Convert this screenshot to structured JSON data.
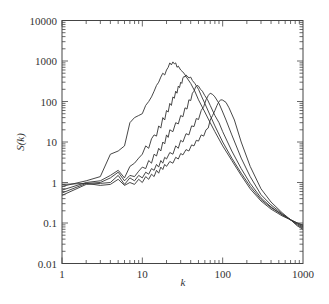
{
  "chart_data": {
    "type": "line",
    "title": "",
    "xlabel": "k",
    "ylabel": "S(k)",
    "xscale": "log",
    "yscale": "log",
    "xlim": [
      1,
      1000
    ],
    "ylim": [
      0.01,
      10000
    ],
    "grid": false,
    "legend": null,
    "x_ticks": [
      1,
      10,
      100,
      1000
    ],
    "x_tick_labels": [
      "1",
      "10",
      "100",
      "1000"
    ],
    "y_ticks": [
      0.01,
      0.1,
      1,
      10,
      100,
      1000,
      10000
    ],
    "y_tick_labels": [
      "0.01",
      "0.1",
      "1",
      "10",
      "100",
      "1000",
      "10000"
    ],
    "line_color": "#333333",
    "series": [
      {
        "name": "curve-1",
        "points": [
          [
            1,
            0.8
          ],
          [
            2,
            1.1
          ],
          [
            3,
            1.4
          ],
          [
            4,
            5
          ],
          [
            5,
            6
          ],
          [
            6,
            8
          ],
          [
            7,
            30
          ],
          [
            8,
            40
          ],
          [
            9,
            45
          ],
          [
            10,
            50
          ],
          [
            11,
            80
          ],
          [
            12,
            100
          ],
          [
            13,
            130
          ],
          [
            14,
            180
          ],
          [
            15,
            250
          ],
          [
            16,
            300
          ],
          [
            17,
            400
          ],
          [
            18,
            500
          ],
          [
            19,
            450
          ],
          [
            20,
            600
          ],
          [
            21,
            700
          ],
          [
            22,
            900
          ],
          [
            23,
            800
          ],
          [
            24,
            950
          ],
          [
            25,
            850
          ],
          [
            26,
            900
          ],
          [
            27,
            700
          ],
          [
            28,
            750
          ],
          [
            30,
            600
          ],
          [
            33,
            500
          ],
          [
            36,
            380
          ],
          [
            40,
            280
          ],
          [
            45,
            180
          ],
          [
            50,
            110
          ],
          [
            60,
            55
          ],
          [
            70,
            30
          ],
          [
            80,
            18
          ],
          [
            100,
            8
          ],
          [
            130,
            3.5
          ],
          [
            170,
            1.5
          ],
          [
            220,
            0.7
          ],
          [
            300,
            0.35
          ],
          [
            400,
            0.22
          ],
          [
            550,
            0.15
          ],
          [
            700,
            0.12
          ],
          [
            850,
            0.1
          ],
          [
            1000,
            0.09
          ]
        ]
      },
      {
        "name": "curve-2",
        "points": [
          [
            1,
            0.65
          ],
          [
            2,
            1.0
          ],
          [
            3,
            1.1
          ],
          [
            4,
            1.5
          ],
          [
            5,
            2.0
          ],
          [
            6,
            1.3
          ],
          [
            7,
            2.5
          ],
          [
            8,
            3
          ],
          [
            9,
            4
          ],
          [
            10,
            5
          ],
          [
            11,
            8
          ],
          [
            12,
            7
          ],
          [
            13,
            12
          ],
          [
            14,
            15
          ],
          [
            15,
            14
          ],
          [
            16,
            25
          ],
          [
            17,
            22
          ],
          [
            18,
            40
          ],
          [
            19,
            35
          ],
          [
            20,
            60
          ],
          [
            21,
            55
          ],
          [
            22,
            90
          ],
          [
            23,
            80
          ],
          [
            24,
            130
          ],
          [
            25,
            120
          ],
          [
            26,
            180
          ],
          [
            27,
            160
          ],
          [
            28,
            240
          ],
          [
            29,
            220
          ],
          [
            30,
            300
          ],
          [
            31,
            280
          ],
          [
            32,
            380
          ],
          [
            33,
            420
          ],
          [
            34,
            400
          ],
          [
            35,
            450
          ],
          [
            36,
            430
          ],
          [
            38,
            380
          ],
          [
            40,
            400
          ],
          [
            42,
            330
          ],
          [
            45,
            280
          ],
          [
            50,
            200
          ],
          [
            55,
            130
          ],
          [
            60,
            90
          ],
          [
            70,
            45
          ],
          [
            80,
            25
          ],
          [
            100,
            10
          ],
          [
            130,
            4
          ],
          [
            170,
            1.7
          ],
          [
            220,
            0.8
          ],
          [
            300,
            0.38
          ],
          [
            400,
            0.24
          ],
          [
            550,
            0.16
          ],
          [
            700,
            0.12
          ],
          [
            850,
            0.1
          ],
          [
            1000,
            0.085
          ]
        ]
      },
      {
        "name": "curve-3",
        "points": [
          [
            1,
            0.55
          ],
          [
            2,
            0.95
          ],
          [
            3,
            1.0
          ],
          [
            4,
            1.3
          ],
          [
            5,
            1.8
          ],
          [
            6,
            1.1
          ],
          [
            7,
            1.5
          ],
          [
            8,
            1.4
          ],
          [
            9,
            1.9
          ],
          [
            10,
            2.4
          ],
          [
            11,
            2.2
          ],
          [
            12,
            3.5
          ],
          [
            13,
            3.0
          ],
          [
            14,
            5
          ],
          [
            15,
            4.5
          ],
          [
            16,
            7
          ],
          [
            17,
            6
          ],
          [
            18,
            10
          ],
          [
            19,
            9
          ],
          [
            20,
            15
          ],
          [
            21,
            13
          ],
          [
            22,
            20
          ],
          [
            24,
            18
          ],
          [
            26,
            30
          ],
          [
            28,
            28
          ],
          [
            30,
            45
          ],
          [
            32,
            42
          ],
          [
            34,
            70
          ],
          [
            36,
            65
          ],
          [
            38,
            110
          ],
          [
            40,
            105
          ],
          [
            42,
            160
          ],
          [
            44,
            180
          ],
          [
            46,
            230
          ],
          [
            48,
            250
          ],
          [
            50,
            240
          ],
          [
            53,
            200
          ],
          [
            56,
            180
          ],
          [
            60,
            140
          ],
          [
            65,
            110
          ],
          [
            70,
            80
          ],
          [
            80,
            45
          ],
          [
            90,
            30
          ],
          [
            100,
            18
          ],
          [
            130,
            6
          ],
          [
            170,
            2.2
          ],
          [
            220,
            0.95
          ],
          [
            300,
            0.42
          ],
          [
            400,
            0.25
          ],
          [
            550,
            0.16
          ],
          [
            700,
            0.12
          ],
          [
            850,
            0.095
          ],
          [
            1000,
            0.08
          ]
        ]
      },
      {
        "name": "curve-4",
        "points": [
          [
            1,
            0.48
          ],
          [
            2,
            0.9
          ],
          [
            3,
            0.95
          ],
          [
            4,
            1.0
          ],
          [
            5,
            1.5
          ],
          [
            6,
            0.9
          ],
          [
            7,
            1.3
          ],
          [
            8,
            1.1
          ],
          [
            9,
            1.5
          ],
          [
            10,
            1.3
          ],
          [
            11,
            1.8
          ],
          [
            12,
            1.6
          ],
          [
            13,
            2.2
          ],
          [
            14,
            2.0
          ],
          [
            15,
            2.8
          ],
          [
            16,
            2.4
          ],
          [
            17,
            3.5
          ],
          [
            18,
            3.0
          ],
          [
            19,
            4.2
          ],
          [
            20,
            3.8
          ],
          [
            22,
            5.5
          ],
          [
            24,
            5
          ],
          [
            26,
            8
          ],
          [
            28,
            7
          ],
          [
            30,
            11
          ],
          [
            32,
            10
          ],
          [
            35,
            16
          ],
          [
            38,
            15
          ],
          [
            41,
            25
          ],
          [
            44,
            24
          ],
          [
            47,
            38
          ],
          [
            50,
            36
          ],
          [
            54,
            60
          ],
          [
            58,
            75
          ],
          [
            62,
            110
          ],
          [
            66,
            140
          ],
          [
            70,
            160
          ],
          [
            75,
            150
          ],
          [
            80,
            130
          ],
          [
            90,
            90
          ],
          [
            100,
            55
          ],
          [
            110,
            35
          ],
          [
            130,
            15
          ],
          [
            170,
            4
          ],
          [
            220,
            1.4
          ],
          [
            300,
            0.5
          ],
          [
            400,
            0.28
          ],
          [
            550,
            0.17
          ],
          [
            700,
            0.12
          ],
          [
            850,
            0.09
          ],
          [
            1000,
            0.075
          ]
        ]
      },
      {
        "name": "curve-5",
        "points": [
          [
            1,
            0.9
          ],
          [
            2,
            0.95
          ],
          [
            3,
            0.85
          ],
          [
            4,
            0.9
          ],
          [
            5,
            1.2
          ],
          [
            6,
            0.85
          ],
          [
            7,
            1.0
          ],
          [
            8,
            0.9
          ],
          [
            9,
            1.2
          ],
          [
            10,
            1.0
          ],
          [
            11,
            1.4
          ],
          [
            12,
            1.2
          ],
          [
            13,
            1.6
          ],
          [
            14,
            1.4
          ],
          [
            15,
            2.0
          ],
          [
            16,
            1.7
          ],
          [
            17,
            2.4
          ],
          [
            18,
            2.1
          ],
          [
            19,
            2.8
          ],
          [
            20,
            2.5
          ],
          [
            22,
            3.3
          ],
          [
            24,
            3.0
          ],
          [
            26,
            4.2
          ],
          [
            28,
            3.8
          ],
          [
            30,
            5.2
          ],
          [
            32,
            4.8
          ],
          [
            35,
            6.5
          ],
          [
            38,
            6.0
          ],
          [
            41,
            8.5
          ],
          [
            44,
            8.0
          ],
          [
            47,
            11
          ],
          [
            50,
            10.5
          ],
          [
            54,
            15
          ],
          [
            58,
            14
          ],
          [
            62,
            20
          ],
          [
            66,
            22
          ],
          [
            70,
            35
          ],
          [
            75,
            45
          ],
          [
            80,
            60
          ],
          [
            85,
            80
          ],
          [
            90,
            100
          ],
          [
            95,
            110
          ],
          [
            100,
            108
          ],
          [
            110,
            95
          ],
          [
            120,
            70
          ],
          [
            140,
            35
          ],
          [
            170,
            10
          ],
          [
            220,
            2.5
          ],
          [
            300,
            0.7
          ],
          [
            400,
            0.33
          ],
          [
            550,
            0.18
          ],
          [
            700,
            0.12
          ],
          [
            850,
            0.085
          ],
          [
            1000,
            0.07
          ]
        ]
      }
    ]
  }
}
